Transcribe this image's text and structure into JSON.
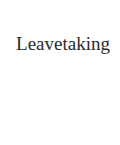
{
  "page": {
    "title": "Leavetaking"
  }
}
